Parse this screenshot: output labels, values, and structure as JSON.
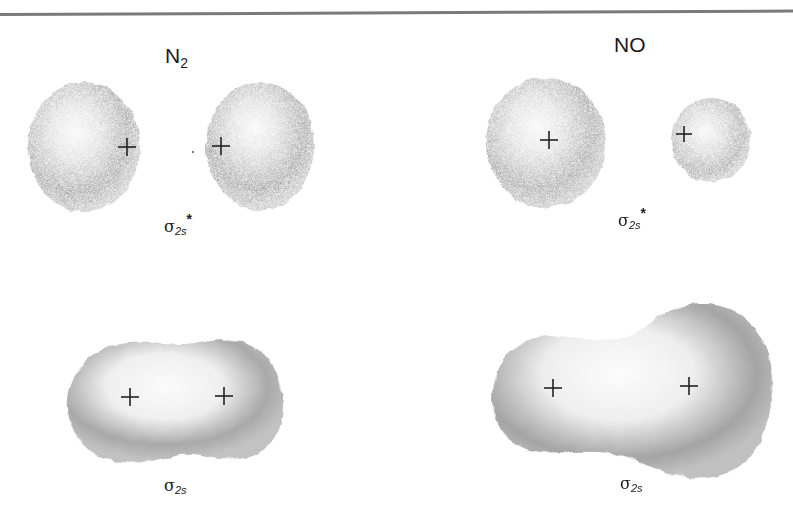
{
  "figure": {
    "columns": [
      {
        "title": "N",
        "title_sub": "2",
        "orbitals": [
          {
            "symbol": "σ",
            "subscript": "2s",
            "superscript": "*",
            "type": "antibonding"
          },
          {
            "symbol": "σ",
            "subscript": "2s",
            "superscript": "",
            "type": "bonding"
          }
        ]
      },
      {
        "title": "NO",
        "title_sub": "",
        "orbitals": [
          {
            "symbol": "σ",
            "subscript": "2s",
            "superscript": "*",
            "type": "antibonding"
          },
          {
            "symbol": "σ",
            "subscript": "2s",
            "superscript": "",
            "type": "bonding"
          }
        ]
      }
    ],
    "nucleus_marker": "+",
    "colors": {
      "cloud_dark": "#8c8c8c",
      "cloud_light": "#f4f4f4",
      "rule": "#7a7a7a",
      "text": "#1a1a1a"
    }
  }
}
